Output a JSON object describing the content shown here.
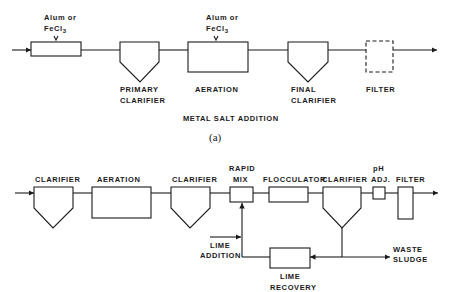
{
  "top_cutoff_text": "is reduced.",
  "diagram_a": {
    "caption": "(a)",
    "title": "METAL SALT ADDITION",
    "chemical_1": {
      "line1": "Alum or",
      "line2": "FeCl",
      "sub": "3"
    },
    "chemical_2": {
      "line1": "Alum or",
      "line2": "FeCl",
      "sub": "3"
    },
    "units": [
      {
        "id": "mixer",
        "label": ""
      },
      {
        "id": "primary-clarifier",
        "line1": "PRIMARY",
        "line2": "CLARIFIER"
      },
      {
        "id": "aeration",
        "line1": "AERATION"
      },
      {
        "id": "final-clarifier",
        "line1": "FINAL",
        "line2": "CLARIFIER"
      },
      {
        "id": "filter",
        "line1": "FILTER"
      }
    ]
  },
  "diagram_b": {
    "units": [
      {
        "id": "clarifier-1",
        "line1": "CLARIFIER"
      },
      {
        "id": "aeration",
        "line1": "AERATION"
      },
      {
        "id": "clarifier-2",
        "line1": "CLARIFIER"
      },
      {
        "id": "rapid-mix",
        "line1": "RAPID",
        "line2": "MIX"
      },
      {
        "id": "flocculator",
        "line1": "FLOCCULATOR"
      },
      {
        "id": "clarifier-3",
        "line1": "CLARIFIER"
      },
      {
        "id": "ph-adj",
        "line1": "pH",
        "line2": "ADJ."
      },
      {
        "id": "filter",
        "line1": "FILTER"
      },
      {
        "id": "lime-recovery",
        "line1": "LIME",
        "line2": "RECOVERY"
      }
    ],
    "lime_addition": {
      "line1": "LIME",
      "line2": "ADDITION"
    },
    "waste_sludge": {
      "line1": "WASTE",
      "line2": "SLUDGE"
    }
  }
}
